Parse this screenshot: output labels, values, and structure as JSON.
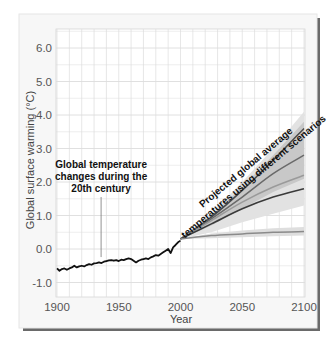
{
  "chart_data": {
    "type": "line",
    "title": "",
    "xlabel": "Year",
    "ylabel": "Global surface warming (°C)",
    "xlim": [
      1900,
      2100
    ],
    "ylim": [
      -1.4,
      6.5
    ],
    "grid": true,
    "legend": "none",
    "x_ticks": [
      1900,
      1950,
      2000,
      2050,
      2100
    ],
    "x_tick_labels": [
      "1900",
      "1950",
      "2000",
      "2050",
      "2100"
    ],
    "y_ticks": [
      -1.0,
      0.0,
      1.0,
      2.0,
      3.0,
      4.0,
      5.0,
      6.0
    ],
    "y_tick_labels": [
      "-1.0",
      "0.0",
      "1.0",
      "2.0",
      "3.0",
      "4.0",
      "5.0",
      "6.0"
    ],
    "annotations": [
      {
        "text": [
          "Global temperature",
          "changes during the",
          "20th century"
        ],
        "x": 1943,
        "y": 2.3,
        "arrow_to": [
          1943,
          -0.3
        ]
      },
      {
        "text": [
          "Projected global average",
          "temperatures using different scenarios"
        ],
        "x": 2040,
        "y": 2.8,
        "rotation": -40
      }
    ],
    "series": [
      {
        "name": "Observed 20th century",
        "color": "#111111",
        "x": [
          1900,
          1902,
          1904,
          1906,
          1908,
          1910,
          1912,
          1914,
          1916,
          1918,
          1920,
          1922,
          1924,
          1926,
          1928,
          1930,
          1932,
          1934,
          1936,
          1938,
          1940,
          1942,
          1944,
          1946,
          1948,
          1950,
          1952,
          1954,
          1956,
          1958,
          1960,
          1962,
          1964,
          1966,
          1968,
          1970,
          1972,
          1974,
          1976,
          1978,
          1980,
          1982,
          1984,
          1986,
          1988,
          1990,
          1992,
          1994,
          1996,
          1998,
          2000
        ],
        "y": [
          -0.58,
          -0.65,
          -0.6,
          -0.58,
          -0.62,
          -0.58,
          -0.55,
          -0.5,
          -0.55,
          -0.52,
          -0.5,
          -0.52,
          -0.48,
          -0.45,
          -0.47,
          -0.43,
          -0.42,
          -0.4,
          -0.42,
          -0.38,
          -0.36,
          -0.34,
          -0.33,
          -0.35,
          -0.33,
          -0.36,
          -0.32,
          -0.33,
          -0.3,
          -0.28,
          -0.3,
          -0.35,
          -0.4,
          -0.35,
          -0.32,
          -0.3,
          -0.28,
          -0.3,
          -0.25,
          -0.22,
          -0.18,
          -0.2,
          -0.15,
          -0.1,
          -0.05,
          0.0,
          -0.12,
          0.05,
          0.12,
          0.2,
          0.25
        ]
      },
      {
        "name": "Scenario high",
        "color": "#4a4a4a",
        "x": [
          2000,
          2025,
          2050,
          2075,
          2100
        ],
        "y": [
          0.3,
          0.95,
          1.75,
          2.65,
          3.6
        ]
      },
      {
        "name": "Scenario mid-high",
        "color": "#6a6a6a",
        "x": [
          2000,
          2025,
          2050,
          2075,
          2100
        ],
        "y": [
          0.3,
          0.9,
          1.55,
          2.25,
          2.8
        ]
      },
      {
        "name": "Scenario mid",
        "color": "#9a9a9a",
        "x": [
          2000,
          2025,
          2050,
          2075,
          2100
        ],
        "y": [
          0.3,
          0.85,
          1.4,
          1.85,
          2.2
        ]
      },
      {
        "name": "Scenario mid-low",
        "color": "#3a3a3a",
        "x": [
          2000,
          2025,
          2050,
          2075,
          2100
        ],
        "y": [
          0.3,
          0.75,
          1.2,
          1.55,
          1.8
        ]
      },
      {
        "name": "Scenario constant",
        "color": "#8a8a8a",
        "x": [
          2000,
          2025,
          2050,
          2075,
          2100
        ],
        "y": [
          0.3,
          0.4,
          0.45,
          0.5,
          0.52
        ]
      }
    ],
    "bands": [
      {
        "name": "outer uncertainty",
        "color": "#e2e2e2",
        "x": [
          2000,
          2025,
          2050,
          2075,
          2100
        ],
        "lower": [
          0.3,
          0.5,
          0.8,
          1.05,
          1.3
        ],
        "upper": [
          0.3,
          1.05,
          2.0,
          3.0,
          4.1
        ]
      },
      {
        "name": "inner uncertainty",
        "color": "#c8c8c8",
        "x": [
          2000,
          2025,
          2050,
          2075,
          2100
        ],
        "lower": [
          0.3,
          0.7,
          1.2,
          1.7,
          2.1
        ],
        "upper": [
          0.3,
          1.0,
          1.85,
          2.8,
          3.8
        ]
      },
      {
        "name": "constant band",
        "color": "#dedede",
        "x": [
          2000,
          2025,
          2050,
          2075,
          2100
        ],
        "lower": [
          0.3,
          0.32,
          0.35,
          0.38,
          0.4
        ],
        "upper": [
          0.3,
          0.46,
          0.55,
          0.62,
          0.66
        ]
      }
    ]
  },
  "colors": {
    "panel_bg": "#f7f7f7",
    "plot_bg": "#ffffff",
    "grid": "#dcdcdc",
    "panel_shadow": "#555555"
  }
}
